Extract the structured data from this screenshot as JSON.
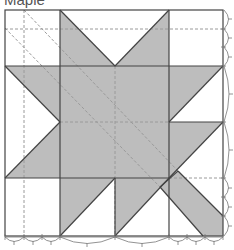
{
  "diagram": {
    "title": "Maple",
    "type": "quilt-block-pattern",
    "grid": {
      "columns": 4,
      "rows": 4
    },
    "colors": {
      "fill": "#bdbdbd",
      "line": "#444444",
      "dashed": "#9a9a9a",
      "background": "#ffffff"
    },
    "pieces": [
      {
        "name": "top-center-left-triangle",
        "shape": "triangle"
      },
      {
        "name": "top-center-right-triangle",
        "shape": "triangle"
      },
      {
        "name": "left-middle-triangles",
        "shape": "triangle-pair"
      },
      {
        "name": "center-square",
        "shape": "square"
      },
      {
        "name": "right-middle-triangles",
        "shape": "triangle-pair"
      },
      {
        "name": "bottom-center-triangles",
        "shape": "triangle-pair"
      },
      {
        "name": "stem",
        "shape": "parallelogram"
      }
    ],
    "measure_marks": {
      "bottom": [
        "small x3",
        "large",
        "large",
        "small x3"
      ],
      "right": [
        "small x3",
        "large",
        "large",
        "small x3"
      ]
    }
  }
}
